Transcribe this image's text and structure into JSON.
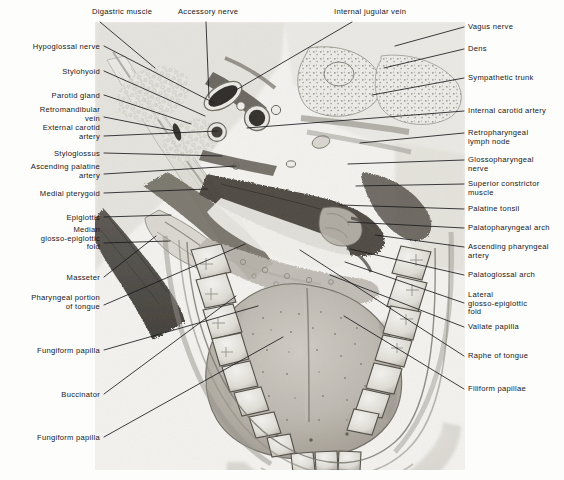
{
  "figure": {
    "style": "grayscale-anatomical-halftone",
    "panel": {
      "x": 95,
      "y": 22,
      "width": 370,
      "height": 448
    },
    "background_color": "#f2f1ee",
    "ink_color": "#17171a"
  },
  "labels": {
    "top": [
      {
        "id": "digastric-muscle",
        "text": "Digastric muscle",
        "x": 92,
        "y": 8,
        "anchor": "start",
        "line": [
          [
            100,
            22
          ],
          [
            155,
            68
          ]
        ]
      },
      {
        "id": "accessory-nerve",
        "text": "Accessory nerve",
        "x": 178,
        "y": 8,
        "anchor": "start",
        "line": [
          [
            206,
            22
          ],
          [
            209,
            98
          ]
        ]
      },
      {
        "id": "internal-jugular-vein",
        "text": "Internal jugular vein",
        "x": 334,
        "y": 8,
        "anchor": "start",
        "line": [
          [
            352,
            22
          ],
          [
            236,
            90
          ]
        ]
      }
    ],
    "left": [
      {
        "id": "hypoglossal-nerve",
        "text": "Hypoglossal nerve",
        "x": 100,
        "y": 43,
        "line": [
          [
            104,
            46
          ],
          [
            214,
            103
          ]
        ]
      },
      {
        "id": "stylohyoid",
        "text": "Stylohyoid",
        "x": 100,
        "y": 68,
        "line": [
          [
            104,
            71
          ],
          [
            205,
            116
          ]
        ]
      },
      {
        "id": "parotid-gland",
        "text": "Parotid gland",
        "x": 100,
        "y": 92,
        "line": [
          [
            104,
            95
          ],
          [
            191,
            124
          ]
        ]
      },
      {
        "id": "retromandibular-vein",
        "text": "Retromandibular\nvein",
        "x": 100,
        "y": 106,
        "line": [
          [
            104,
            117
          ],
          [
            175,
            131
          ]
        ]
      },
      {
        "id": "external-carotid-artery",
        "text": "External carotid\nartery",
        "x": 100,
        "y": 124,
        "line": [
          [
            104,
            136
          ],
          [
            218,
            131
          ]
        ]
      },
      {
        "id": "styloglossus",
        "text": "Styloglossus",
        "x": 100,
        "y": 150,
        "line": [
          [
            104,
            153
          ],
          [
            222,
            156
          ]
        ]
      },
      {
        "id": "ascending-palatine-artery",
        "text": "Ascending palatine\nartery",
        "x": 100,
        "y": 163,
        "line": [
          [
            104,
            174
          ],
          [
            236,
            166
          ]
        ]
      },
      {
        "id": "medial-pterygoid",
        "text": "Medial pterygoid",
        "x": 100,
        "y": 190,
        "line": [
          [
            104,
            193
          ],
          [
            207,
            189
          ]
        ]
      },
      {
        "id": "epiglottis",
        "text": "Epiglottis",
        "x": 100,
        "y": 214,
        "line": [
          [
            104,
            217
          ],
          [
            171,
            215
          ]
        ]
      },
      {
        "id": "median-glosso-epiglottic-fold",
        "text": "Median\nglosso-epiglottic\nfold",
        "x": 100,
        "y": 226,
        "line": [
          [
            104,
            243
          ],
          [
            170,
            241
          ]
        ]
      },
      {
        "id": "masseter",
        "text": "Masseter",
        "x": 100,
        "y": 274,
        "line": [
          [
            104,
            277
          ],
          [
            156,
            236
          ]
        ]
      },
      {
        "id": "pharyngeal-portion-of-tongue",
        "text": "Pharyngeal portion\nof tongue",
        "x": 100,
        "y": 294,
        "line": [
          [
            104,
            305
          ],
          [
            245,
            244
          ]
        ]
      },
      {
        "id": "fungiform-papilla-upper",
        "text": "Fungiform papilla",
        "x": 100,
        "y": 347,
        "line": [
          [
            104,
            350
          ],
          [
            258,
            306
          ]
        ]
      },
      {
        "id": "buccinator",
        "text": "Buccinator",
        "x": 100,
        "y": 391,
        "line": [
          [
            104,
            394
          ],
          [
            236,
            296
          ]
        ]
      },
      {
        "id": "fungiform-papilla-lower",
        "text": "Fungiform papilla",
        "x": 100,
        "y": 434,
        "line": [
          [
            104,
            437
          ],
          [
            283,
            337
          ]
        ]
      }
    ],
    "right": [
      {
        "id": "vagus-nerve",
        "text": "Vagus nerve",
        "x": 468,
        "y": 23,
        "line": [
          [
            464,
            27
          ],
          [
            395,
            46
          ]
        ]
      },
      {
        "id": "dens",
        "text": "Dens",
        "x": 468,
        "y": 45,
        "line": [
          [
            464,
            49
          ],
          [
            384,
            68
          ]
        ]
      },
      {
        "id": "sympathetic-trunk",
        "text": "Sympathetic trunk",
        "x": 468,
        "y": 74,
        "line": [
          [
            464,
            78
          ],
          [
            372,
            95
          ]
        ]
      },
      {
        "id": "internal-carotid-artery",
        "text": "Internal carotid artery",
        "x": 468,
        "y": 107,
        "line": [
          [
            464,
            111
          ],
          [
            247,
            128
          ]
        ]
      },
      {
        "id": "retropharyngeal-lymph-node",
        "text": "Retropharyngeal\nlymph node",
        "x": 468,
        "y": 129,
        "line": [
          [
            464,
            133
          ],
          [
            360,
            143
          ]
        ]
      },
      {
        "id": "glossopharyngeal-nerve",
        "text": "Glossopharyngeal\nnerve",
        "x": 468,
        "y": 156,
        "line": [
          [
            464,
            160
          ],
          [
            348,
            164
          ]
        ]
      },
      {
        "id": "superior-constrictor-muscle",
        "text": "Superior constrictor\nmuscle",
        "x": 468,
        "y": 180,
        "line": [
          [
            464,
            184
          ],
          [
            356,
            186
          ]
        ]
      },
      {
        "id": "palatine-tonsil",
        "text": "Palatine tonsil",
        "x": 468,
        "y": 205,
        "line": [
          [
            464,
            209
          ],
          [
            340,
            205
          ]
        ]
      },
      {
        "id": "palatopharyngeal-arch",
        "text": "Palatopharyngeal arch",
        "x": 468,
        "y": 224,
        "line": [
          [
            464,
            228
          ],
          [
            348,
            222
          ]
        ]
      },
      {
        "id": "ascending-pharyngeal-artery",
        "text": "Ascending pharyngeal\nartery",
        "x": 468,
        "y": 243,
        "line": [
          [
            464,
            247
          ],
          [
            375,
            235
          ]
        ]
      },
      {
        "id": "palatoglossal-arch",
        "text": "Palatoglossal arch",
        "x": 468,
        "y": 271,
        "line": [
          [
            464,
            275
          ],
          [
            350,
            249
          ]
        ]
      },
      {
        "id": "lateral-glosso-epiglottic-fold",
        "text": "Lateral\nglosso-epiglottic\nfold",
        "x": 468,
        "y": 291,
        "line": [
          [
            464,
            303
          ],
          [
            345,
            262
          ]
        ]
      },
      {
        "id": "vallate-papilla",
        "text": "Vallate papilla",
        "x": 468,
        "y": 323,
        "line": [
          [
            464,
            327
          ],
          [
            330,
            275
          ]
        ]
      },
      {
        "id": "raphe-of-tongue",
        "text": "Raphe of tongue",
        "x": 468,
        "y": 352,
        "line": [
          [
            464,
            356
          ],
          [
            300,
            250
          ]
        ]
      },
      {
        "id": "filiform-papillae",
        "text": "Filiform papillae",
        "x": 468,
        "y": 385,
        "line": [
          [
            464,
            389
          ],
          [
            344,
            316
          ]
        ]
      }
    ]
  }
}
